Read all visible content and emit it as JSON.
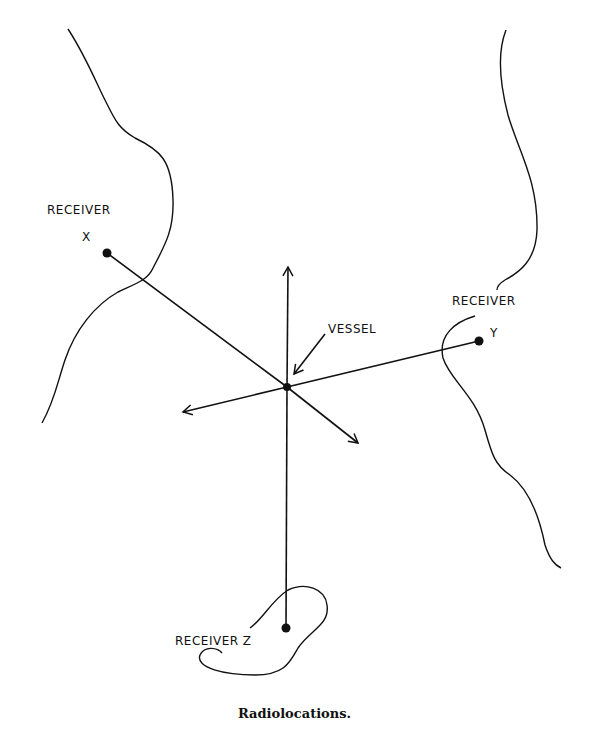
{
  "caption": "Radiolocations.",
  "labels": {
    "receiver_x_line1": "RECEIVER",
    "receiver_x_line2": "X",
    "receiver_y_line1": "RECEIVER",
    "receiver_y_line2": "Y",
    "receiver_z": "RECEIVER Z",
    "vessel": "VESSEL"
  },
  "points": {
    "vessel": {
      "x": 287,
      "y": 387
    },
    "receiver_x": {
      "x": 107,
      "y": 253
    },
    "receiver_y": {
      "x": 479,
      "y": 341
    },
    "receiver_z": {
      "x": 286,
      "y": 628
    }
  },
  "colors": {
    "ink": "#111111",
    "background": "#ffffff"
  }
}
